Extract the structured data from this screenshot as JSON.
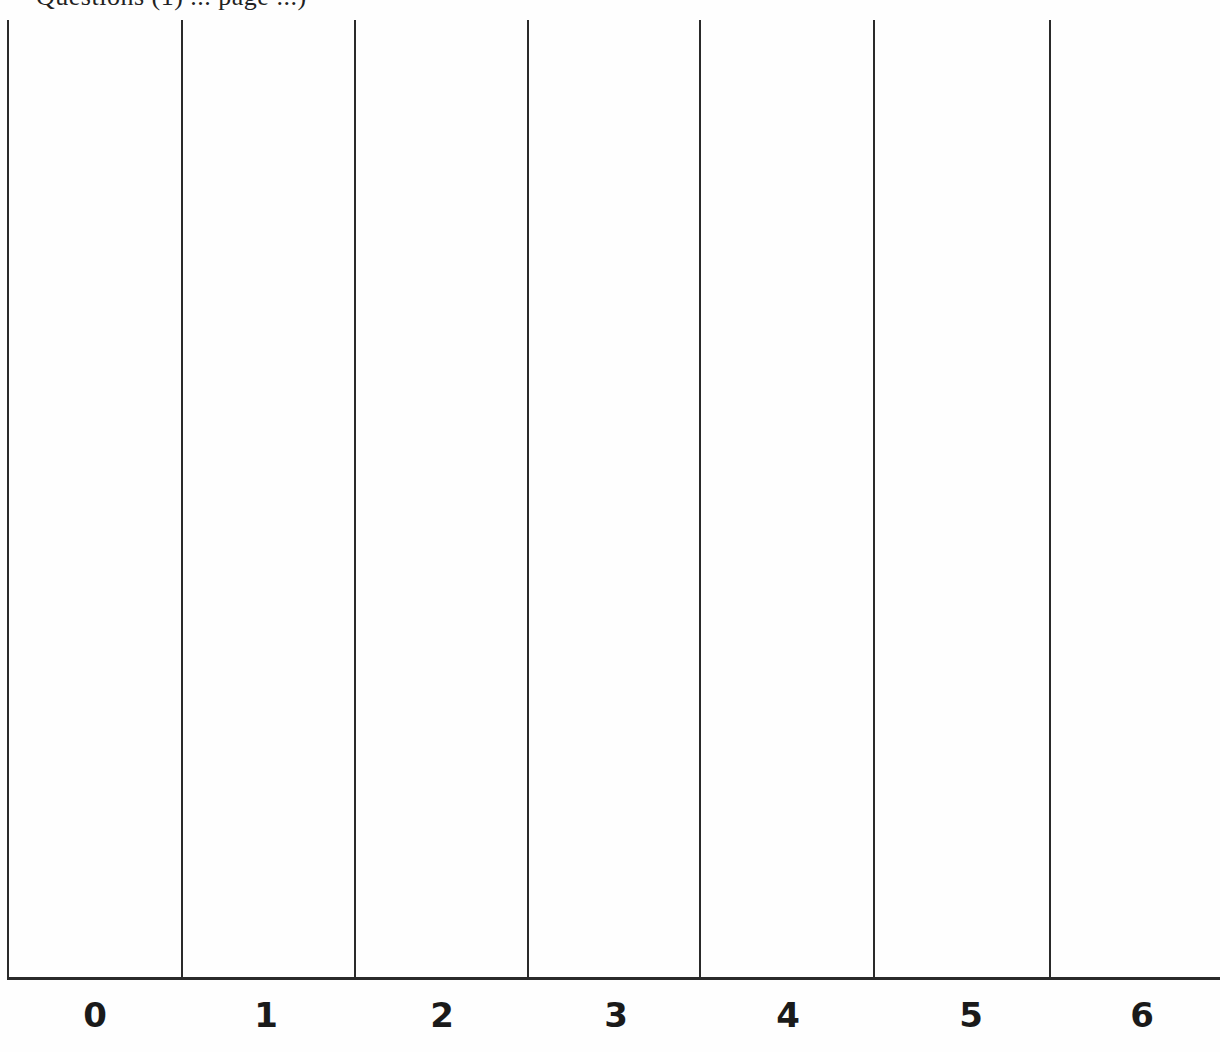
{
  "page": {
    "heading_clipped": "Questions (1) ... page ...)"
  },
  "grid": {
    "line_color": "#2a2a2a",
    "columns": [
      {
        "label": "0",
        "left": 8,
        "right": 182
      },
      {
        "label": "1",
        "left": 182,
        "right": 355
      },
      {
        "label": "2",
        "left": 355,
        "right": 528
      },
      {
        "label": "3",
        "left": 528,
        "right": 700
      },
      {
        "label": "4",
        "left": 700,
        "right": 874
      },
      {
        "label": "5",
        "left": 874,
        "right": 1050
      },
      {
        "label": "6",
        "left": 1050,
        "right": 1220
      }
    ],
    "vertical_lines_x": [
      8,
      182,
      355,
      528,
      700,
      874,
      1050
    ],
    "line_top_y": 20,
    "baseline_y": 978
  }
}
